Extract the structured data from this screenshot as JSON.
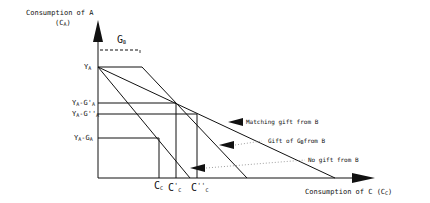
{
  "diagram": {
    "y_axis": {
      "title": "Consumption of A",
      "symbol": "(C",
      "symbol_sub": "A",
      "symbol_close": ")"
    },
    "x_axis": {
      "title": "Consumption of C (C",
      "title_sub": "C",
      "title_close": ")"
    },
    "gb_label": {
      "main": "G",
      "sub": "B"
    },
    "y_labels": [
      {
        "main": "Y",
        "sub": "A",
        "rest": ""
      },
      {
        "main": "Y",
        "sub": "A",
        "rest": "-G'",
        "sub2": "A"
      },
      {
        "main": "Y",
        "sub": "A",
        "rest": "-G''",
        "sub2": "A"
      },
      {
        "main": "Y",
        "sub": "A",
        "rest": "-G",
        "sub2": "A"
      }
    ],
    "x_labels": [
      {
        "main": "C",
        "sub": "C",
        "sup": ""
      },
      {
        "main": "C",
        "sub": "C",
        "sup": "'"
      },
      {
        "main": "C",
        "sub": "C",
        "sup": "''"
      }
    ],
    "annotations": [
      {
        "text": "Matching gift from B"
      },
      {
        "text": "Gift of G",
        "sub": "B",
        "rest": "from B"
      },
      {
        "text": "No gift from B"
      }
    ]
  }
}
